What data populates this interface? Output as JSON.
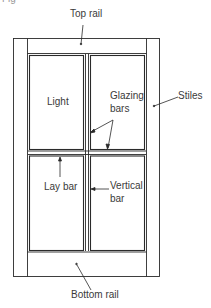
{
  "figure": {
    "caption_partial": "Fig"
  },
  "labels": {
    "top_rail": "Top rail",
    "stiles": "Stiles",
    "light": "Light",
    "glazing_bars_line1": "Glazing",
    "glazing_bars_line2": "bars",
    "lay_bar": "Lay bar",
    "vertical_bar_line1": "Vertical",
    "vertical_bar_line2": "bar",
    "bottom_rail": "Bottom rail"
  },
  "colors": {
    "line": "#2a2a2a",
    "background": "#ffffff",
    "text": "#3a3a3a"
  }
}
